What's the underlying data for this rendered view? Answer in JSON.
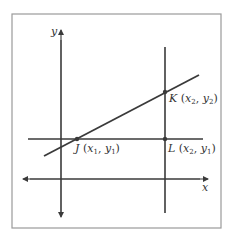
{
  "diagram": {
    "axes": {
      "x_label": "x",
      "y_label": "y"
    },
    "points": [
      {
        "name": "J",
        "label": "J",
        "coords": [
          "x",
          "1",
          "y",
          "1"
        ]
      },
      {
        "name": "K",
        "label": "K",
        "coords": [
          "x",
          "2",
          "y",
          "2"
        ]
      },
      {
        "name": "L",
        "label": "L",
        "coords": [
          "x",
          "2",
          "y",
          "1"
        ]
      }
    ],
    "colors": {
      "line": "#3a3a3a",
      "frame": "#9a9a9a",
      "text": "#333333"
    }
  }
}
